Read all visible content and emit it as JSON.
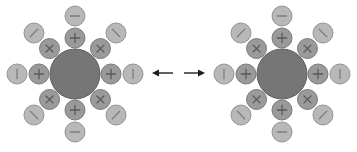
{
  "figure": {
    "background_color": "#ffffff",
    "width": 357,
    "height": 152
  },
  "colors": {
    "core_fill": "#767676",
    "core_stroke": "#5e5e5e",
    "inner_fill": "#9a9a9a",
    "inner_stroke": "#7a7a7a",
    "outer_fill": "#b8b8b8",
    "outer_stroke": "#949494",
    "glyph_inner": "#5a5a5a",
    "glyph_outer": "#7d7d7d",
    "arrow": "#1d1d1d"
  },
  "geometry": {
    "core_radius": 25,
    "inner_radius": 10,
    "outer_radius": 10,
    "inner_orbit": 36,
    "outer_orbit": 58
  },
  "structures": [
    {
      "id": "structure-left",
      "label": "left resonance structure",
      "center": {
        "x": 75,
        "y": 74
      },
      "core": {
        "name": "central-sphere",
        "symbol": ""
      },
      "inner_shell": [
        {
          "angle": -90,
          "symbol": "+",
          "name": "inner-node-plus-top"
        },
        {
          "angle": -45,
          "symbol": "×",
          "name": "inner-node-cross-top-right"
        },
        {
          "angle": 0,
          "symbol": "+",
          "name": "inner-node-plus-right"
        },
        {
          "angle": 45,
          "symbol": "×",
          "name": "inner-node-cross-bottom-right"
        },
        {
          "angle": 90,
          "symbol": "+",
          "name": "inner-node-plus-bottom"
        },
        {
          "angle": 135,
          "symbol": "×",
          "name": "inner-node-cross-bottom-left"
        },
        {
          "angle": 180,
          "symbol": "+",
          "name": "inner-node-plus-left"
        },
        {
          "angle": -135,
          "symbol": "×",
          "name": "inner-node-cross-top-left"
        }
      ],
      "outer_shell": [
        {
          "angle": -90,
          "symbol": "−",
          "name": "outer-node-minus-top"
        },
        {
          "angle": -45,
          "symbol": "\\",
          "name": "outer-node-backslash-top-right"
        },
        {
          "angle": 0,
          "symbol": "|",
          "name": "outer-node-bar-right"
        },
        {
          "angle": 45,
          "symbol": "/",
          "name": "outer-node-slash-bottom-right"
        },
        {
          "angle": 90,
          "symbol": "−",
          "name": "outer-node-minus-bottom"
        },
        {
          "angle": 135,
          "symbol": "\\",
          "name": "outer-node-backslash-bottom-left"
        },
        {
          "angle": 180,
          "symbol": "|",
          "name": "outer-node-bar-left"
        },
        {
          "angle": -135,
          "symbol": "/",
          "name": "outer-node-slash-top-left"
        }
      ]
    },
    {
      "id": "structure-right",
      "label": "right resonance structure",
      "center": {
        "x": 282,
        "y": 74
      },
      "core": {
        "name": "central-sphere",
        "symbol": ""
      },
      "inner_shell": [
        {
          "angle": -90,
          "symbol": "+",
          "name": "inner-node-plus-top"
        },
        {
          "angle": -45,
          "symbol": "×",
          "name": "inner-node-cross-top-right"
        },
        {
          "angle": 0,
          "symbol": "+",
          "name": "inner-node-plus-right"
        },
        {
          "angle": 45,
          "symbol": "×",
          "name": "inner-node-cross-bottom-right"
        },
        {
          "angle": 90,
          "symbol": "+",
          "name": "inner-node-plus-bottom"
        },
        {
          "angle": 135,
          "symbol": "×",
          "name": "inner-node-cross-bottom-left"
        },
        {
          "angle": 180,
          "symbol": "+",
          "name": "inner-node-plus-left"
        },
        {
          "angle": -135,
          "symbol": "×",
          "name": "inner-node-cross-top-left"
        }
      ],
      "outer_shell": [
        {
          "angle": -90,
          "symbol": "−",
          "name": "outer-node-minus-top"
        },
        {
          "angle": -45,
          "symbol": "\\",
          "name": "outer-node-backslash-top-right"
        },
        {
          "angle": 0,
          "symbol": "|",
          "name": "outer-node-bar-right"
        },
        {
          "angle": 45,
          "symbol": "/",
          "name": "outer-node-slash-bottom-right"
        },
        {
          "angle": 90,
          "symbol": "−",
          "name": "outer-node-minus-bottom"
        },
        {
          "angle": 135,
          "symbol": "\\",
          "name": "outer-node-backslash-bottom-left"
        },
        {
          "angle": 180,
          "symbol": "|",
          "name": "outer-node-bar-left"
        },
        {
          "angle": -135,
          "symbol": "/",
          "name": "outer-node-slash-top-left"
        }
      ]
    }
  ],
  "connector": {
    "name": "resonance-arrow",
    "type": "double-headed",
    "symbol": "↔",
    "left_segment": {
      "x1": 152,
      "x2": 173,
      "y": 73
    },
    "right_segment": {
      "x1": 184,
      "x2": 205,
      "y": 73
    }
  }
}
